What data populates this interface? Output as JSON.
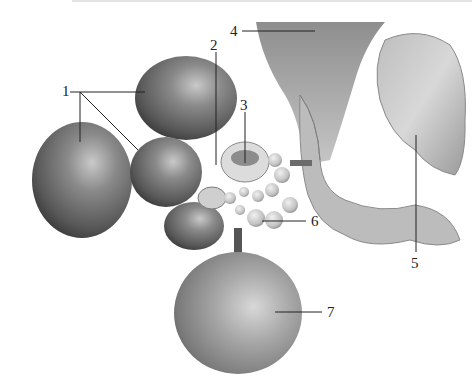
{
  "figure": {
    "labels": [
      {
        "id": "1",
        "text": "1",
        "x": 62,
        "y": 84
      },
      {
        "id": "2",
        "text": "2",
        "x": 210,
        "y": 38
      },
      {
        "id": "3",
        "text": "3",
        "x": 240,
        "y": 98
      },
      {
        "id": "4",
        "text": "4",
        "x": 230,
        "y": 25
      },
      {
        "id": "5",
        "text": "5",
        "x": 411,
        "y": 283
      },
      {
        "id": "6",
        "text": "6",
        "x": 311,
        "y": 214
      },
      {
        "id": "7",
        "text": "7",
        "x": 327,
        "y": 304
      }
    ]
  }
}
